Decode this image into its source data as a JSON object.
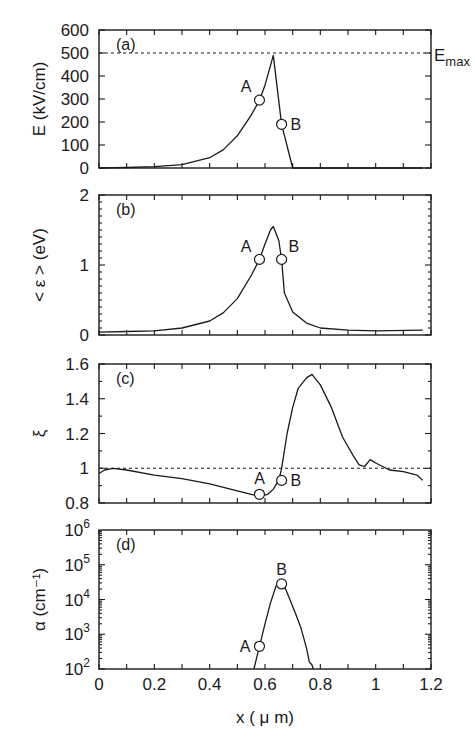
{
  "chart_data": [
    {
      "panel": "(a)",
      "type": "line",
      "ylabel": "E (kV/cm)",
      "xlabel": "",
      "xlim": [
        0,
        1.2
      ],
      "ylim": [
        0,
        600
      ],
      "yticks": [
        "0",
        "100",
        "200",
        "300",
        "400",
        "500",
        "600"
      ],
      "reference_line": {
        "y": 500,
        "style": "dashed",
        "label": "E",
        "label_sub": "max"
      },
      "x": [
        0,
        0.1,
        0.2,
        0.3,
        0.4,
        0.45,
        0.5,
        0.55,
        0.58,
        0.6,
        0.63,
        0.66,
        0.7,
        0.8,
        1.0,
        1.17
      ],
      "y": [
        0,
        2,
        6,
        15,
        45,
        80,
        140,
        230,
        295,
        360,
        490,
        190,
        0,
        0,
        0,
        0
      ],
      "points": [
        {
          "label": "A",
          "x": 0.58,
          "y": 295
        },
        {
          "label": "B",
          "x": 0.66,
          "y": 190
        }
      ]
    },
    {
      "panel": "(b)",
      "type": "line",
      "ylabel": "< ε > (eV)",
      "xlabel": "",
      "xlim": [
        0,
        1.2
      ],
      "ylim": [
        0,
        2
      ],
      "yticks": [
        "0",
        "1",
        "2"
      ],
      "x": [
        0,
        0.1,
        0.2,
        0.3,
        0.4,
        0.45,
        0.5,
        0.55,
        0.58,
        0.6,
        0.62,
        0.63,
        0.65,
        0.66,
        0.67,
        0.7,
        0.75,
        0.8,
        0.9,
        1.0,
        1.17
      ],
      "y": [
        0.04,
        0.05,
        0.06,
        0.1,
        0.2,
        0.32,
        0.52,
        0.85,
        1.08,
        1.3,
        1.5,
        1.55,
        1.35,
        1.08,
        0.6,
        0.33,
        0.17,
        0.1,
        0.07,
        0.06,
        0.07
      ],
      "points": [
        {
          "label": "A",
          "x": 0.58,
          "y": 1.08
        },
        {
          "label": "B",
          "x": 0.66,
          "y": 1.08
        }
      ]
    },
    {
      "panel": "(c)",
      "type": "line",
      "ylabel": "ξ",
      "xlabel": "",
      "xlim": [
        0,
        1.2
      ],
      "ylim": [
        0.8,
        1.6
      ],
      "yticks": [
        "0.8",
        "1",
        "1.2",
        "1.4",
        "1.6"
      ],
      "reference_line": {
        "y": 1.0,
        "style": "dashed"
      },
      "x": [
        0,
        0.02,
        0.05,
        0.1,
        0.2,
        0.3,
        0.4,
        0.5,
        0.55,
        0.58,
        0.61,
        0.63,
        0.65,
        0.66,
        0.68,
        0.7,
        0.72,
        0.75,
        0.77,
        0.8,
        0.84,
        0.88,
        0.92,
        0.94,
        0.96,
        0.98,
        1.0,
        1.05,
        1.1,
        1.15,
        1.17
      ],
      "y": [
        0.97,
        0.99,
        1.0,
        0.99,
        0.96,
        0.94,
        0.91,
        0.87,
        0.85,
        0.84,
        0.85,
        0.88,
        0.93,
        1.0,
        1.2,
        1.35,
        1.46,
        1.52,
        1.54,
        1.48,
        1.35,
        1.18,
        1.07,
        1.02,
        1.01,
        1.05,
        1.03,
        0.99,
        0.98,
        0.96,
        0.93
      ],
      "points": [
        {
          "label": "A",
          "x": 0.58,
          "y": 0.85
        },
        {
          "label": "B",
          "x": 0.66,
          "y": 0.93
        }
      ]
    },
    {
      "panel": "(d)",
      "type": "line",
      "yscale": "log",
      "ylabel": "α (cm⁻¹)",
      "xlabel": "x ( μ m)",
      "xlim": [
        0,
        1.2
      ],
      "ylim": [
        100,
        1000000
      ],
      "yticks": [
        "10^2",
        "10^3",
        "10^4",
        "10^5",
        "10^6"
      ],
      "xticks": [
        "0",
        "0.2",
        "0.4",
        "0.6",
        "0.8",
        "1",
        "1.2"
      ],
      "x": [
        0.56,
        0.58,
        0.6,
        0.62,
        0.64,
        0.655,
        0.67,
        0.69,
        0.71,
        0.73,
        0.75,
        0.76,
        0.77,
        0.775
      ],
      "y": [
        100,
        450,
        2000,
        8000,
        25000,
        32000,
        24000,
        10000,
        4000,
        1500,
        400,
        160,
        130,
        100
      ],
      "points": [
        {
          "label": "A",
          "x": 0.58,
          "y": 450
        },
        {
          "label": "B",
          "x": 0.66,
          "y": 28000
        }
      ]
    }
  ]
}
